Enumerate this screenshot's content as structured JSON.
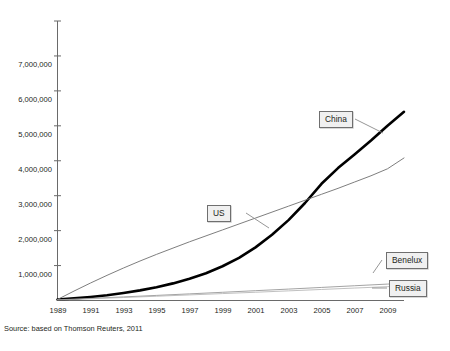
{
  "caption": {
    "text": "Figure 1. Growth of scientific publication output of China, the US, Benelux and Russia (1989–2010)"
  },
  "source": {
    "text": "Source: based on Thomson Reuters, 2011"
  },
  "callouts": {
    "china": "China",
    "us": "US",
    "benelux": "Benelux",
    "russia": "Russia"
  },
  "chart_data": {
    "type": "line",
    "title": "",
    "xlabel": "",
    "ylabel": "",
    "xlim": [
      1989,
      2010
    ],
    "ylim": [
      0,
      8000000
    ],
    "grid": false,
    "legend_position": "inline-callouts",
    "y_tick_labels": [
      "1,000,000",
      "2,000,000",
      "3,000,000",
      "4,000,000",
      "5,000,000",
      "6,000,000",
      "7,000,000"
    ],
    "y_tick_values": [
      1000000,
      2000000,
      3000000,
      4000000,
      5000000,
      6000000,
      7000000
    ],
    "x_tick_labels": [
      "1989",
      "1991",
      "1993",
      "1995",
      "1997",
      "1999",
      "2001",
      "2003",
      "2005",
      "2007",
      "2009"
    ],
    "x_tick_values": [
      1989,
      1991,
      1993,
      1995,
      1997,
      1999,
      2001,
      2003,
      2005,
      2007,
      2009
    ],
    "x": [
      1989,
      1990,
      1991,
      1992,
      1993,
      1994,
      1995,
      1996,
      1997,
      1998,
      1999,
      2000,
      2001,
      2002,
      2003,
      2004,
      2005,
      2006,
      2007,
      2008,
      2009,
      2010
    ],
    "series": [
      {
        "name": "China",
        "color": "#000000",
        "line_width": 2.6,
        "values": [
          30000,
          60000,
          100000,
          150000,
          215000,
          290000,
          380000,
          490000,
          620000,
          780000,
          980000,
          1220000,
          1520000,
          1880000,
          2300000,
          2790000,
          3340000,
          3790000,
          4180000,
          4580000,
          5000000,
          5400000
        ]
      },
      {
        "name": "US",
        "color": "#6f6f6f",
        "line_width": 0.9,
        "values": [
          30000,
          270000,
          500000,
          720000,
          930000,
          1130000,
          1320000,
          1500000,
          1680000,
          1850000,
          2020000,
          2190000,
          2360000,
          2530000,
          2700000,
          2870000,
          3040000,
          3210000,
          3390000,
          3570000,
          3770000,
          4080000
        ]
      },
      {
        "name": "Benelux",
        "color": "#8c8c8c",
        "line_width": 0.8,
        "values": [
          20000,
          40000,
          61000,
          82000,
          103000,
          124000,
          146000,
          168000,
          190000,
          212000,
          235000,
          258000,
          281000,
          304000,
          327000,
          350000,
          374000,
          398000,
          422000,
          446000,
          470000,
          495000
        ]
      },
      {
        "name": "Russia",
        "color": "#b0b0b0",
        "line_width": 0.8,
        "values": [
          15000,
          32000,
          50000,
          68000,
          86000,
          104000,
          122000,
          141000,
          160000,
          179000,
          198000,
          217000,
          236000,
          256000,
          276000,
          296000,
          316000,
          336000,
          356000,
          376000,
          397000,
          420000
        ]
      }
    ]
  }
}
